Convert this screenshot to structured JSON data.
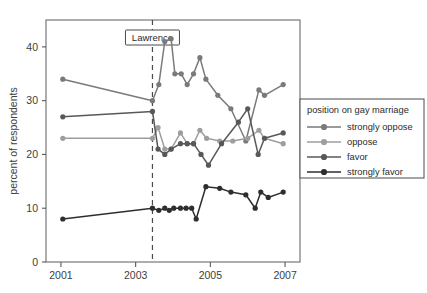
{
  "chart_data": {
    "type": "line",
    "title": "",
    "xlabel": "",
    "ylabel": "percent of respondents",
    "xlim": [
      2000.6,
      2007.4
    ],
    "ylim": [
      0,
      45
    ],
    "grid": false,
    "legend_position": "right",
    "legend_title": "position on gay marriage",
    "x_ticks": [
      "2001",
      "2003",
      "2005",
      "2007"
    ],
    "x_tick_values": [
      2001,
      2003,
      2005,
      2007
    ],
    "y_ticks": [
      "0",
      "10",
      "20",
      "30",
      "40"
    ],
    "y_tick_values": [
      0,
      10,
      20,
      30,
      40
    ],
    "annotations": [
      {
        "label": "Lawrence",
        "type": "vertical-dashed-line",
        "x": 2003.45
      }
    ],
    "series": [
      {
        "name": "strongly oppose",
        "color": "#7a7a7a",
        "x": [
          2001.05,
          2003.45,
          2003.62,
          2003.78,
          2003.95,
          2004.05,
          2004.22,
          2004.38,
          2004.55,
          2004.72,
          2004.88,
          2005.2,
          2005.55,
          2005.95,
          2006.3,
          2006.45,
          2006.95
        ],
        "values": [
          34,
          30,
          33,
          41,
          41.5,
          35,
          35,
          33,
          35,
          38,
          34,
          31,
          28.5,
          22.5,
          32,
          31,
          33
        ]
      },
      {
        "name": "oppose",
        "color": "#9e9e9e",
        "x": [
          2001.05,
          2003.45,
          2003.6,
          2003.78,
          2003.95,
          2004.2,
          2004.38,
          2004.55,
          2004.72,
          2004.9,
          2005.25,
          2005.6,
          2006.0,
          2006.3,
          2006.45,
          2006.95
        ],
        "values": [
          23,
          23,
          25,
          21,
          21,
          24,
          22,
          22,
          24.5,
          23,
          22.5,
          22.5,
          23,
          24.5,
          23,
          22
        ]
      },
      {
        "name": "favor",
        "color": "#585858",
        "x": [
          2001.05,
          2003.45,
          2003.6,
          2003.78,
          2003.95,
          2004.2,
          2004.38,
          2004.55,
          2004.75,
          2004.95,
          2005.3,
          2005.75,
          2006.0,
          2006.28,
          2006.45,
          2006.95
        ],
        "values": [
          27,
          28,
          21,
          20,
          21,
          22,
          22,
          22,
          20,
          18,
          22,
          26,
          28.5,
          20,
          23,
          24
        ]
      },
      {
        "name": "strongly favor",
        "color": "#2e2e2e",
        "x": [
          2001.05,
          2003.45,
          2003.62,
          2003.78,
          2003.9,
          2004.02,
          2004.2,
          2004.35,
          2004.5,
          2004.62,
          2004.88,
          2005.25,
          2005.55,
          2005.95,
          2006.2,
          2006.35,
          2006.55,
          2006.95
        ],
        "values": [
          8,
          10,
          9.6,
          10,
          9.6,
          10,
          10,
          10,
          10,
          8,
          14,
          13.7,
          13,
          12.5,
          10,
          13,
          12,
          13
        ]
      }
    ]
  }
}
